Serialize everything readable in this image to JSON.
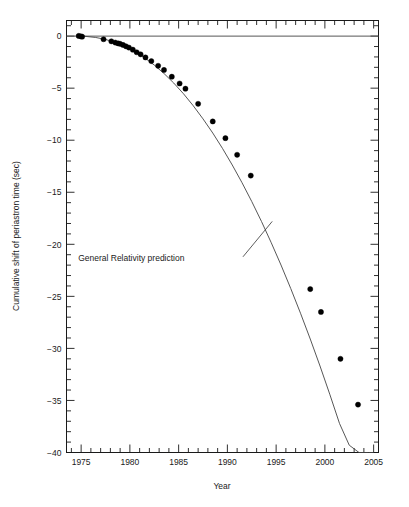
{
  "chart_data": {
    "type": "scatter",
    "title": "",
    "subtitle": "",
    "xlabel": "Year",
    "ylabel": "Cumulative shift of periastron time (sec)",
    "xlim": [
      1973.5,
      2005.5
    ],
    "ylim": [
      -40,
      1.5
    ],
    "grid": false,
    "legend": "none",
    "x_major_ticks": [
      1975,
      1980,
      1985,
      1990,
      1995,
      2000,
      2005
    ],
    "x_major_tick_labels": [
      "1975",
      "1980",
      "1985",
      "1990",
      "1995",
      "2000",
      "2005"
    ],
    "x_minor_tick_step": 1,
    "y_major_ticks": [
      0,
      -5,
      -10,
      -15,
      -20,
      -25,
      -30,
      -35,
      -40
    ],
    "y_major_tick_labels": [
      "0",
      "−5",
      "−10",
      "−15",
      "−20",
      "−25",
      "−30",
      "−35",
      "−40"
    ],
    "y_minor_tick_step": 1,
    "annotations": [
      {
        "text": "General Relativity prediction",
        "text_x": 1985.6,
        "text_y": -21.6,
        "leader_from_x": 1991.6,
        "leader_from_y": -21.2,
        "leader_to_x": 1994.6,
        "leader_to_y": -17.8
      }
    ],
    "series": [
      {
        "name": "General Relativity prediction",
        "type": "line",
        "color": "#444444",
        "x": [
          1974.7,
          1975.5,
          1976.5,
          1977.5,
          1978.5,
          1979.5,
          1980.5,
          1981.5,
          1982.5,
          1983.5,
          1984.5,
          1985.5,
          1986.5,
          1987.5,
          1988.5,
          1989.5,
          1990.5,
          1991.5,
          1992.5,
          1993.5,
          1994.5,
          1995.5,
          1996.5,
          1997.5,
          1998.5,
          1999.5,
          2000.5,
          2001.5,
          2002.5,
          2003.5,
          2004.5,
          2005.0
        ],
        "y": [
          0.0,
          -0.03,
          -0.13,
          -0.32,
          -0.6,
          -0.99,
          -1.48,
          -2.07,
          -2.78,
          -3.59,
          -4.51,
          -5.54,
          -6.69,
          -7.95,
          -9.31,
          -10.79,
          -12.38,
          -14.08,
          -15.89,
          -17.81,
          -19.85,
          -21.99,
          -24.25,
          -26.62,
          -29.1,
          -31.69,
          -34.4,
          -37.21,
          -39.3,
          -40.0,
          -40.0,
          -40.0
        ]
      },
      {
        "name": "Measured cumulative periastron shift",
        "type": "scatter",
        "color": "#000000",
        "marker": "filled-circle",
        "points": [
          {
            "x": 1974.75,
            "y": 0.02
          },
          {
            "x": 1974.95,
            "y": -0.02
          },
          {
            "x": 1975.1,
            "y": -0.05
          },
          {
            "x": 1977.3,
            "y": -0.3
          },
          {
            "x": 1978.1,
            "y": -0.5
          },
          {
            "x": 1978.5,
            "y": -0.62
          },
          {
            "x": 1978.8,
            "y": -0.7
          },
          {
            "x": 1979.0,
            "y": -0.74
          },
          {
            "x": 1979.3,
            "y": -0.85
          },
          {
            "x": 1979.6,
            "y": -0.98
          },
          {
            "x": 1979.9,
            "y": -1.1
          },
          {
            "x": 1980.3,
            "y": -1.3
          },
          {
            "x": 1980.7,
            "y": -1.55
          },
          {
            "x": 1981.1,
            "y": -1.75
          },
          {
            "x": 1981.6,
            "y": -2.05
          },
          {
            "x": 1982.2,
            "y": -2.4
          },
          {
            "x": 1982.9,
            "y": -2.85
          },
          {
            "x": 1983.5,
            "y": -3.25
          },
          {
            "x": 1984.3,
            "y": -3.9
          },
          {
            "x": 1985.1,
            "y": -4.55
          },
          {
            "x": 1985.7,
            "y": -5.05
          },
          {
            "x": 1987.0,
            "y": -6.5
          },
          {
            "x": 1988.5,
            "y": -8.2
          },
          {
            "x": 1989.8,
            "y": -9.8
          },
          {
            "x": 1991.0,
            "y": -11.4
          },
          {
            "x": 1992.4,
            "y": -13.4
          },
          {
            "x": 1998.5,
            "y": -24.3
          },
          {
            "x": 1999.6,
            "y": -26.5
          },
          {
            "x": 2001.6,
            "y": -31.0
          },
          {
            "x": 2003.4,
            "y": -35.4
          }
        ]
      }
    ]
  },
  "figure": {
    "background_color": "#ffffff",
    "frame_color": "#1a1a1a",
    "zero_line_label": "zero reference line"
  }
}
